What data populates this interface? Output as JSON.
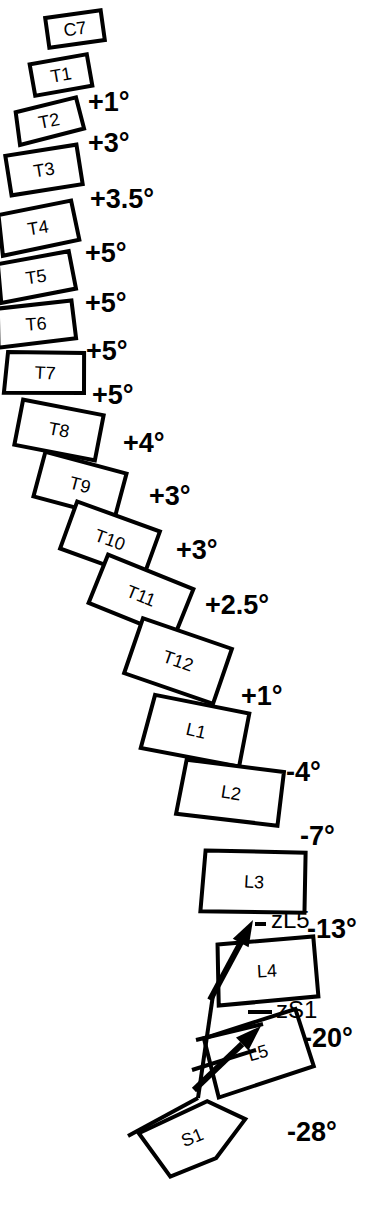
{
  "figure": {
    "stroke_color": "#000000",
    "background_color": "#ffffff"
  },
  "vertebrae": [
    {
      "label": "C7",
      "cx": 75,
      "cy": 29,
      "rot": -8,
      "w": 56,
      "h": 30,
      "shape": "rect"
    },
    {
      "label": "T1",
      "cx": 61,
      "cy": 75,
      "rot": -10,
      "w": 58,
      "h": 32,
      "shape": "rect"
    },
    {
      "label": "T2",
      "cx": 49,
      "cy": 121,
      "rot": -11,
      "w": 62,
      "h": 34,
      "shape": "trap"
    },
    {
      "label": "T3",
      "cx": 44,
      "cy": 170,
      "rot": -9,
      "w": 72,
      "h": 40,
      "shape": "rect"
    },
    {
      "label": "T4",
      "cx": 38,
      "cy": 228,
      "rot": -9,
      "w": 74,
      "h": 42,
      "shape": "trap"
    },
    {
      "label": "T5",
      "cx": 36,
      "cy": 277,
      "rot": -8,
      "w": 72,
      "h": 40,
      "shape": "trap"
    },
    {
      "label": "T6",
      "cx": 36,
      "cy": 324,
      "rot": -4,
      "w": 74,
      "h": 40,
      "shape": "trap"
    },
    {
      "label": "T7",
      "cx": 45,
      "cy": 373,
      "rot": 3,
      "w": 76,
      "h": 42,
      "shape": "trap"
    },
    {
      "label": "T8",
      "cx": 59,
      "cy": 430,
      "rot": 11,
      "w": 82,
      "h": 46,
      "shape": "rect"
    },
    {
      "label": "T9",
      "cx": 80,
      "cy": 485,
      "rot": 15,
      "w": 84,
      "h": 46,
      "shape": "rect"
    },
    {
      "label": "T10",
      "cx": 110,
      "cy": 540,
      "rot": 20,
      "w": 88,
      "h": 50,
      "shape": "rect"
    },
    {
      "label": "T11",
      "cx": 141,
      "cy": 596,
      "rot": 22,
      "w": 92,
      "h": 52,
      "shape": "rect"
    },
    {
      "label": "T12",
      "cx": 178,
      "cy": 661,
      "rot": 19,
      "w": 94,
      "h": 58,
      "shape": "rect"
    },
    {
      "label": "L1",
      "cx": 196,
      "cy": 731,
      "rot": 13,
      "w": 96,
      "h": 56,
      "shape": "trap"
    },
    {
      "label": "L2",
      "cx": 231,
      "cy": 793,
      "rot": 9,
      "w": 98,
      "h": 56,
      "shape": "trap"
    },
    {
      "label": "L3",
      "cx": 254,
      "cy": 882,
      "rot": 3,
      "w": 100,
      "h": 62,
      "shape": "trap"
    },
    {
      "label": "L4",
      "cx": 267,
      "cy": 971,
      "rot": -3,
      "w": 96,
      "h": 62,
      "shape": "trap"
    },
    {
      "label": "L5",
      "cx": 258,
      "cy": 1053,
      "rot": -16,
      "w": 96,
      "h": 62,
      "shape": "trap"
    },
    {
      "label": "S1",
      "cx": 196,
      "cy": 1136,
      "rot": -22,
      "w": 104,
      "h": 56,
      "shape": "pentagon"
    }
  ],
  "angles": [
    {
      "value": "+1°",
      "x": 88,
      "y": 111
    },
    {
      "value": "+3°",
      "x": 88,
      "y": 152
    },
    {
      "value": "+3.5°",
      "x": 90,
      "y": 208
    },
    {
      "value": "+5°",
      "x": 85,
      "y": 262
    },
    {
      "value": "+5°",
      "x": 85,
      "y": 312
    },
    {
      "value": "+5°",
      "x": 86,
      "y": 360
    },
    {
      "value": "+5°",
      "x": 92,
      "y": 404
    },
    {
      "value": "+4°",
      "x": 123,
      "y": 452
    },
    {
      "value": "+3°",
      "x": 149,
      "y": 505
    },
    {
      "value": "+3°",
      "x": 176,
      "y": 559
    },
    {
      "value": "+2.5°",
      "x": 205,
      "y": 614
    },
    {
      "value": "+1°",
      "x": 241,
      "y": 705
    },
    {
      "value": "-4°",
      "x": 286,
      "y": 781
    },
    {
      "value": "-7°",
      "x": 300,
      "y": 845
    },
    {
      "value": "-13°",
      "x": 307,
      "y": 938
    },
    {
      "value": "-20°",
      "x": 303,
      "y": 1047
    },
    {
      "value": "-28°",
      "x": 287,
      "y": 1141
    }
  ],
  "vectors": [
    {
      "name": "zL5",
      "label": "zL5",
      "label_x": 271,
      "label_y": 928,
      "tail_x": 210,
      "tail_y": 1000,
      "tip_x": 253,
      "tip_y": 920,
      "leader_x1": 255,
      "leader_y1": 924,
      "leader_x2": 266,
      "leader_y2": 924
    },
    {
      "name": "zS1",
      "label": "zS1",
      "label_x": 276,
      "label_y": 1018,
      "tail_x": 194,
      "tail_y": 1090,
      "tip_x": 261,
      "tip_y": 1026,
      "leader_x1": 248,
      "leader_y1": 1012,
      "leader_x2": 272,
      "leader_y2": 1012
    }
  ],
  "reference_lines": [
    {
      "name": "vertical-plumb",
      "x1": 198,
      "y1": 1098,
      "x2": 128,
      "y2": 1136
    },
    {
      "name": "plumb-upper",
      "x1": 198,
      "y1": 1098,
      "x2": 213,
      "y2": 995
    },
    {
      "name": "l4-endplate-ext",
      "x1": 196,
      "y1": 1040,
      "x2": 263,
      "y2": 1024
    },
    {
      "name": "l5-endplate-ext",
      "x1": 192,
      "y1": 1070,
      "x2": 256,
      "y2": 1050
    }
  ]
}
